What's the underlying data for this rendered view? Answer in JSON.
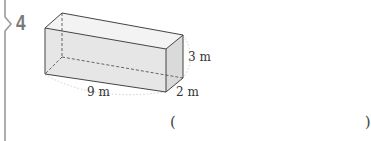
{
  "problem": {
    "number": "4",
    "number_color": "#7a7a7a"
  },
  "figure": {
    "shape": "rectangular-prism",
    "dimensions": {
      "length": "9 m",
      "height": "3 m",
      "width": "2 m"
    },
    "face_fill": "#ececec",
    "edge_color": "#444444"
  },
  "answer": {
    "open_paren": "(",
    "close_paren": ")",
    "value": ""
  }
}
